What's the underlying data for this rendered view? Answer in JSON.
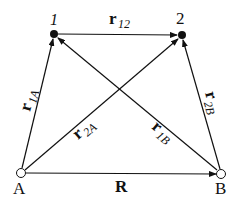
{
  "diagram": {
    "points": {
      "p1": {
        "label": "1",
        "x": 54,
        "y": 34
      },
      "p2": {
        "label": "2",
        "x": 182,
        "y": 35
      },
      "A": {
        "label": "A",
        "x": 21,
        "y": 173
      },
      "B": {
        "label": "B",
        "x": 221,
        "y": 174
      }
    },
    "vectors": {
      "r12": {
        "main": "r",
        "sub": "12"
      },
      "r1A": {
        "main": "r",
        "sub": "1A"
      },
      "r2A": {
        "main": "r",
        "sub": "2A"
      },
      "r1B": {
        "main": "r",
        "sub": "1B"
      },
      "r2B": {
        "main": "r",
        "sub": "2B"
      },
      "R": {
        "main": "R"
      }
    }
  }
}
